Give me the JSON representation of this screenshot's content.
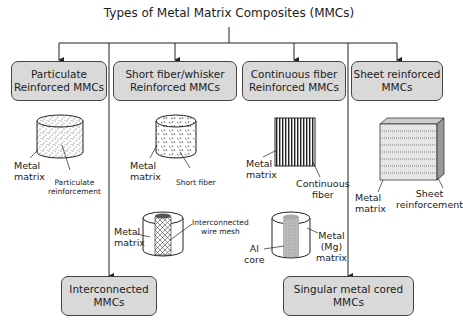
{
  "title": "Types of Metal Matrix Composites (MMCs)",
  "boxes": {
    "particulate": "Particulate\nReinforced MMCs",
    "short_fiber": "Short fiber/whisker\nReinforced MMCs",
    "continuous_fiber": "Continuous fiber\nReinforced MMCs",
    "sheet": "Sheet reinforced\nMMCs",
    "interconnected": "Interconnected\nMMCs",
    "singular_cored": "Singular metal cored\nMMCs"
  },
  "labels": {
    "particulate": {
      "matrix": "Metal\nmatrix",
      "reinforcement": "Particulate\nreinforcement"
    },
    "short_fiber": {
      "matrix": "Metal\nmatrix",
      "reinforcement": "Short fiber"
    },
    "continuous_fiber": {
      "matrix": "Metal\nmatrix",
      "reinforcement": "Continuous\nfiber"
    },
    "sheet": {
      "matrix": "Metal\nmatrix",
      "reinforcement": "Sheet\nreinforcement"
    },
    "interconnected": {
      "matrix": "Metal\nmatrix",
      "reinforcement": "Interconnected\nwire mesh"
    },
    "singular_cored": {
      "core": "Al\ncore",
      "matrix": "Metal\n(Mg)\nmatrix"
    }
  },
  "colors": {
    "box_fill": "#d9d9d9",
    "line": "#222222"
  }
}
